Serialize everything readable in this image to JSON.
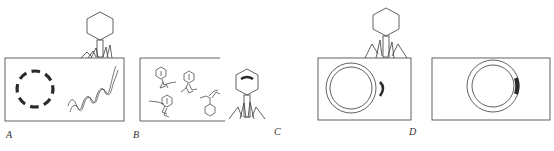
{
  "figure": {
    "stroke_color": "#3a3a3a",
    "fill_color": "#2a2a2a",
    "panels": [
      {
        "id": "A",
        "label": "A",
        "content": "phage attached on cell; circularized DNA fragments (dashed circle) and injected helical DNA"
      },
      {
        "id": "B",
        "label": "B",
        "content": "cell containing assembled progeny phages; single released phage beside cell"
      },
      {
        "id": "C",
        "label": "C",
        "content": "phage attached on cell; double-ring bacterial chromosome and separate phage DNA segment"
      },
      {
        "id": "D",
        "label": "D",
        "content": "double-ring bacterial chromosome with integrated phage DNA segment (prophage)"
      }
    ]
  }
}
